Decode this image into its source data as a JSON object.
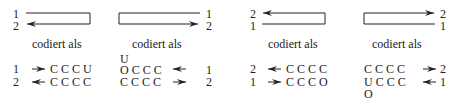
{
  "caption": "codiert als",
  "panels": [
    {
      "top_labels": [
        "1",
        "2"
      ],
      "rows": [
        {
          "label": "1",
          "arrow": "right",
          "code": "C C C U"
        },
        {
          "label": "2",
          "arrow": "left",
          "code": "C C C C"
        }
      ]
    },
    {
      "top_labels": [
        "1",
        "2"
      ],
      "extra_top": "U",
      "rows": [
        {
          "label": "1",
          "arrow": "left",
          "code": "O C C C"
        },
        {
          "label": "2",
          "arrow": "right",
          "code": "C C C C"
        }
      ]
    },
    {
      "top_labels": [
        "2",
        "1"
      ],
      "rows": [
        {
          "label": "2",
          "arrow": "left",
          "code": "C C C C"
        },
        {
          "label": "1",
          "arrow": "right",
          "code": "C C C O"
        }
      ]
    },
    {
      "top_labels": [
        "2",
        "1"
      ],
      "extra_bottom": "O",
      "rows": [
        {
          "label": "2",
          "arrow": "right",
          "code": "C C C C"
        },
        {
          "label": "1",
          "arrow": "left",
          "code": "U C C C"
        }
      ]
    }
  ]
}
